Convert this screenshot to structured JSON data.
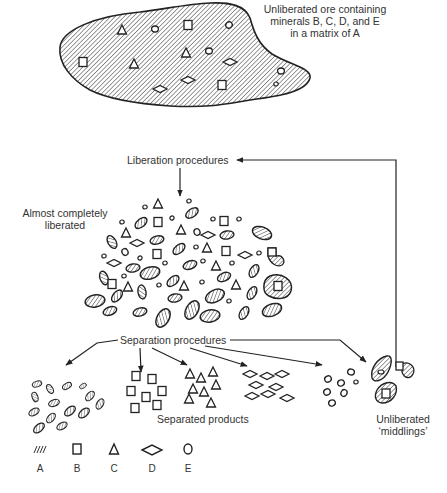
{
  "diagram": {
    "ore_label": [
      "Unliberated ore containing",
      "minerals B, C, D, and E",
      "in a matrix of A"
    ],
    "liberation_label": "Liberation procedures",
    "almost_liberated_label": [
      "Almost completely",
      "liberated"
    ],
    "separation_label": "Separation procedures",
    "separated_products_label": "Separated products",
    "middlings_label": [
      "Unliberated",
      "‘middlings’"
    ],
    "legend": [
      {
        "key": "A",
        "shape": "hatched-matrix"
      },
      {
        "key": "B",
        "shape": "square"
      },
      {
        "key": "C",
        "shape": "triangle"
      },
      {
        "key": "D",
        "shape": "diamond"
      },
      {
        "key": "E",
        "shape": "circle"
      }
    ],
    "caption_partial": "(caption text cut off at bottom edge)",
    "colors": {
      "ink": "#222222",
      "background": "#ffffff"
    }
  }
}
